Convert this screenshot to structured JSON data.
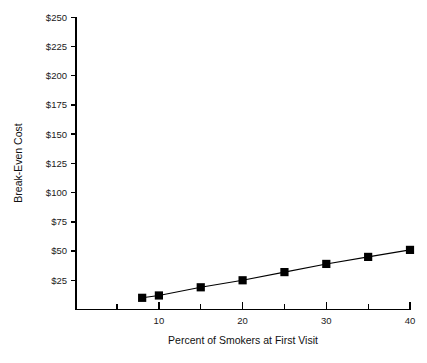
{
  "chart_data": {
    "type": "line",
    "title": "",
    "xlabel": "Percent of Smokers at First Visit",
    "ylabel": "Break-Even Cost",
    "xlim": [
      0,
      40
    ],
    "ylim": [
      0,
      250
    ],
    "grid": false,
    "legend": null,
    "marker": "square",
    "line_color": "#000000",
    "marker_color": "#000000",
    "x_tick_labels": [
      "10",
      "20",
      "30",
      "40"
    ],
    "x_tick_values": [
      10,
      20,
      30,
      40
    ],
    "x_minor_tick_values": [
      0,
      5,
      15,
      25,
      35
    ],
    "y_tick_labels": [
      "$25",
      "$50",
      "$75",
      "$100",
      "$125",
      "$150",
      "$175",
      "$200",
      "$225",
      "$250"
    ],
    "y_tick_values": [
      25,
      50,
      75,
      100,
      125,
      150,
      175,
      200,
      225,
      250
    ],
    "x": [
      8,
      10,
      15,
      20,
      25,
      30,
      35,
      40
    ],
    "values": [
      10,
      12,
      19,
      25,
      32,
      39,
      45,
      51
    ],
    "points": [
      {
        "x": 8,
        "y": 10
      },
      {
        "x": 10,
        "y": 12
      },
      {
        "x": 15,
        "y": 19
      },
      {
        "x": 20,
        "y": 25
      },
      {
        "x": 25,
        "y": 32
      },
      {
        "x": 30,
        "y": 39
      },
      {
        "x": 35,
        "y": 45
      },
      {
        "x": 40,
        "y": 51
      }
    ]
  }
}
